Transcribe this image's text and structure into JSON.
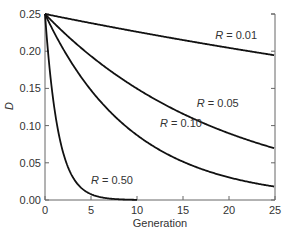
{
  "chart_data": {
    "type": "line",
    "title": "",
    "xlabel": "Generation",
    "ylabel": "D",
    "xlim": [
      0,
      25
    ],
    "ylim": [
      0,
      0.25
    ],
    "xticks": [
      0,
      5,
      10,
      15,
      20,
      25
    ],
    "yticks": [
      0.0,
      0.05,
      0.1,
      0.15,
      0.2,
      0.25
    ],
    "xtick_labels": [
      "0",
      "5",
      "10",
      "15",
      "20",
      "25"
    ],
    "ytick_labels": [
      "0.00",
      "0.05",
      "0.10",
      "0.15",
      "0.20",
      "0.25"
    ],
    "grid": false,
    "legend": "inline labels",
    "formula_note": "D_t = 0.25 * (1 - R)^t",
    "series": [
      {
        "name": "R = 0.01",
        "R": 0.01,
        "label_pos": [
          18.5,
          0.217
        ],
        "x": [
          0,
          5,
          10,
          15,
          20,
          25
        ],
        "values": [
          0.25,
          0.238,
          0.226,
          0.215,
          0.205,
          0.195
        ]
      },
      {
        "name": "R = 0.05",
        "R": 0.05,
        "label_pos": [
          16.5,
          0.125
        ],
        "x": [
          0,
          5,
          10,
          15,
          20,
          25
        ],
        "values": [
          0.25,
          0.193,
          0.15,
          0.116,
          0.09,
          0.069
        ]
      },
      {
        "name": "R = 0.10",
        "R": 0.1,
        "label_pos": [
          12.5,
          0.098
        ],
        "x": [
          0,
          5,
          10,
          15,
          20,
          25
        ],
        "values": [
          0.25,
          0.148,
          0.087,
          0.051,
          0.03,
          0.018
        ]
      },
      {
        "name": "R = 0.50",
        "R": 0.5,
        "label_pos": [
          5.0,
          0.022
        ],
        "x": [
          0,
          1,
          2,
          3,
          4,
          5,
          6,
          7,
          8,
          9,
          10
        ],
        "values": [
          0.25,
          0.125,
          0.0625,
          0.031,
          0.016,
          0.008,
          0.004,
          0.002,
          0.001,
          0.0005,
          0.0002
        ]
      }
    ]
  }
}
